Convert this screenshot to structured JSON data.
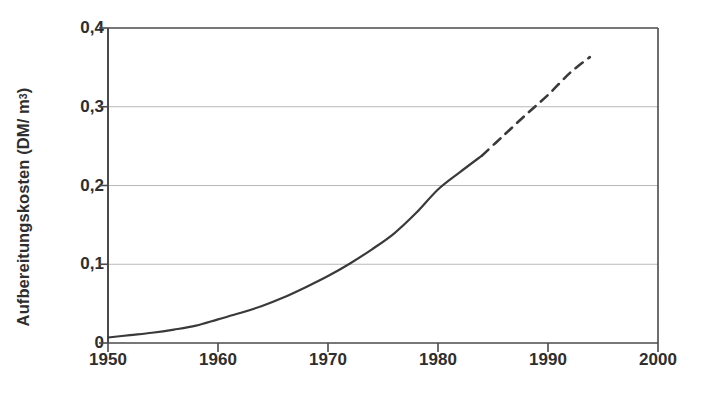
{
  "chart_data": {
    "type": "line",
    "title": "",
    "subtitle": "",
    "xlabel": "",
    "ylabel": "Aufbereitungskosten (DM/ m3)",
    "ylabel_parts": {
      "main": "Aufbereitungskosten (DM/ m",
      "sup": "3",
      "tail": ")"
    },
    "xlim": [
      1950,
      2000
    ],
    "ylim": [
      0,
      0.4
    ],
    "xticks": [
      1950,
      1960,
      1970,
      1980,
      1990,
      2000
    ],
    "xticklabels": [
      "1950",
      "1960",
      "1970",
      "1980",
      "1990",
      "2000"
    ],
    "yticks": [
      0,
      0.1,
      0.2,
      0.3,
      0.4
    ],
    "yticklabels": [
      "0",
      "0,1",
      "0,2",
      "0,3",
      "0,4"
    ],
    "grid": "horizontal",
    "legend": null,
    "series": [
      {
        "name": "Aufbereitungskosten (gemessen)",
        "style": "solid",
        "color": "#3a3a3a",
        "x": [
          1950,
          1952,
          1954,
          1956,
          1958,
          1960,
          1962,
          1964,
          1966,
          1968,
          1970,
          1972,
          1974,
          1976,
          1978,
          1980,
          1982,
          1984
        ],
        "y": [
          0.007,
          0.01,
          0.013,
          0.017,
          0.022,
          0.03,
          0.038,
          0.047,
          0.058,
          0.071,
          0.085,
          0.101,
          0.119,
          0.139,
          0.165,
          0.195,
          0.217,
          0.238
        ]
      },
      {
        "name": "Aufbereitungskosten (Prognose)",
        "style": "dashed",
        "color": "#3a3a3a",
        "x": [
          1984,
          1986,
          1988,
          1990,
          1992,
          1993.8
        ],
        "y": [
          0.238,
          0.264,
          0.29,
          0.315,
          0.343,
          0.363
        ]
      }
    ],
    "annotations": []
  },
  "axes": {
    "y_tick_labels": [
      "0,4",
      "0,3",
      "0,2",
      "0,1",
      "0"
    ],
    "x_tick_labels": [
      "1950",
      "1960",
      "1970",
      "1980",
      "1990",
      "2000"
    ],
    "y_axis_title": "Aufbereitungskosten (DM/ m",
    "y_axis_title_sup": "3",
    "y_axis_title_tail": ")"
  },
  "colors": {
    "curve": "#3a3a3a",
    "axis": "#4a4a4a",
    "grid": "#b9b9b9",
    "text": "#2e2e2e",
    "background": "#ffffff"
  }
}
